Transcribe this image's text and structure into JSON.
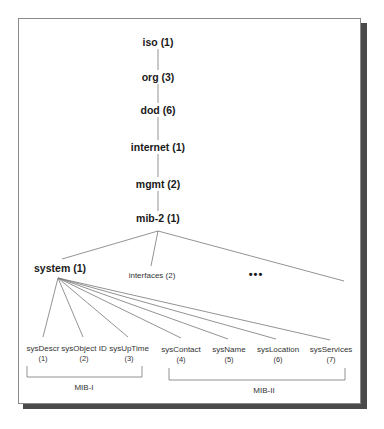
{
  "diagram": {
    "spine": [
      {
        "label": "iso (1)",
        "x": 158,
        "y": 42
      },
      {
        "label": "org (3)",
        "x": 158,
        "y": 77
      },
      {
        "label": "dod (6)",
        "x": 158,
        "y": 110
      },
      {
        "label": "internet (1)",
        "x": 158,
        "y": 147
      },
      {
        "label": "mgmt (2)",
        "x": 158,
        "y": 184
      },
      {
        "label": "mib-2 (1)",
        "x": 158,
        "y": 218
      }
    ],
    "mib2_children": [
      {
        "label": "system (1)",
        "x": 60,
        "y": 268,
        "style": "bold"
      },
      {
        "label": "interfaces (2)",
        "x": 152,
        "y": 275,
        "style": "regular"
      },
      {
        "label": "•••",
        "x": 256,
        "y": 274,
        "style": "ellipsis"
      }
    ],
    "system_children": [
      {
        "name": "sysDescr",
        "num": "(1)",
        "x": 43
      },
      {
        "name": "sysObject ID",
        "num": "(2)",
        "x": 84
      },
      {
        "name": "sysUpTime",
        "num": "(3)",
        "x": 129
      },
      {
        "name": "sysContact",
        "num": "(4)",
        "x": 181
      },
      {
        "name": "sysName",
        "num": "(5)",
        "x": 229
      },
      {
        "name": "sysLocation",
        "num": "(6)",
        "x": 278
      },
      {
        "name": "sysServices",
        "num": "(7)",
        "x": 331
      }
    ],
    "groups": [
      {
        "label": "MIB-I",
        "x1": 27,
        "x2": 142,
        "label_x": 84,
        "label_y": 387
      },
      {
        "label": "MIB-II",
        "x1": 169,
        "x2": 345,
        "label_x": 264,
        "label_y": 390
      }
    ],
    "colors": {
      "line": "#777777",
      "frame_border": "#8a8a8a",
      "shadow": "#4a4a4a",
      "text": "#1a1a1a"
    }
  }
}
